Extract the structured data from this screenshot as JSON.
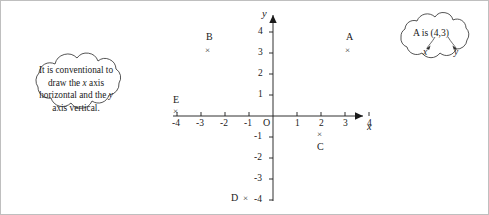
{
  "figure": {
    "name": "cartesian-coordinate-plane-figure",
    "background": "#ffffff",
    "border_color": "#bfbfbf",
    "ink_color": "#1a1a1a"
  },
  "axes": {
    "x_axis_label": "x",
    "y_axis_label": "y",
    "origin_label": "O",
    "x_ticks": [
      "-4",
      "-3",
      "-2",
      "-1",
      "1",
      "2",
      "3",
      "4"
    ],
    "y_ticks_positive": [
      "4",
      "3",
      "2",
      "1"
    ],
    "y_ticks_negative": [
      "-1",
      "-2",
      "-3",
      "-4"
    ],
    "x_range": [
      -4,
      4
    ],
    "y_range": [
      -4,
      4
    ]
  },
  "points": [
    {
      "label": "A",
      "marker": "×",
      "x": 4,
      "y": 3,
      "label_pos": "above"
    },
    {
      "label": "B",
      "marker": "×",
      "x": -3,
      "y": 2,
      "label_pos": "above"
    },
    {
      "label": "C",
      "marker": "×",
      "x": 2,
      "y": -1,
      "label_pos": "below"
    },
    {
      "label": "D",
      "marker": "×",
      "x": -1,
      "y": -4,
      "label_pos": "left"
    },
    {
      "label": "E",
      "marker": "×",
      "x": -4,
      "y": 0,
      "label_pos": "above"
    }
  ],
  "clouds": {
    "left": {
      "name": "convention-note-cloud",
      "line1": "It is conventional to",
      "line2_pre": "draw the ",
      "line2_italic": "x",
      "line2_post": " axis",
      "line3_pre": "horizontal and the ",
      "line3_italic": "y",
      "line4": "axis vertical."
    },
    "right": {
      "name": "coordinate-callout-cloud",
      "statement": "A is (4,3)",
      "x_caption": "x",
      "y_caption": "y"
    }
  }
}
